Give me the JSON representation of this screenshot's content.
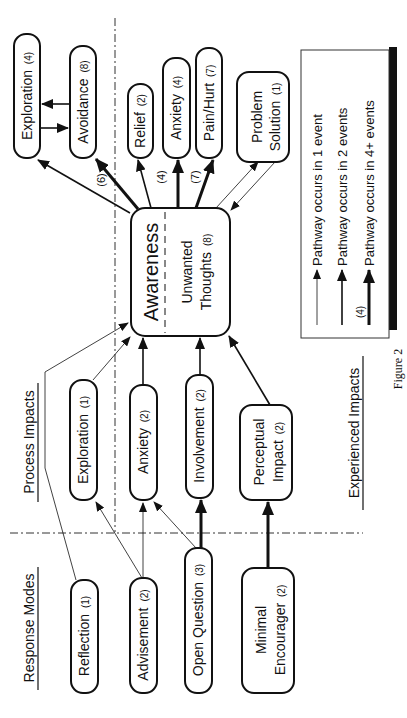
{
  "figure": {
    "caption": "Figure 2",
    "orientation": "rotated-90-ccw"
  },
  "sections": {
    "response_modes": "Response Modes",
    "process_impacts": "Process Impacts",
    "experienced_impacts": "Experienced Impacts"
  },
  "response_modes": [
    {
      "id": "reflection",
      "label": "Reflection",
      "count": "(1)"
    },
    {
      "id": "advisement",
      "label": "Advisement",
      "count": "(2)"
    },
    {
      "id": "open_question",
      "label": "Open Question",
      "count": "(3)"
    },
    {
      "id": "minimal_encourager",
      "label_line1": "Minimal",
      "label_line2": "Encourager",
      "count": "(2)"
    }
  ],
  "process_impacts": [
    {
      "id": "exploration",
      "label": "Exploration",
      "count": "(1)"
    },
    {
      "id": "anxiety",
      "label": "Anxiety",
      "count": "(2)"
    },
    {
      "id": "involvement",
      "label": "Involvement",
      "count": "(2)"
    },
    {
      "id": "perceptual_impact",
      "label_line1": "Perceptual",
      "label_line2": "Impact",
      "count": "(2)"
    }
  ],
  "central": {
    "title": "Awareness",
    "sub_line1": "Unwanted",
    "sub_line2": "Thoughts",
    "sub_count": "(8)"
  },
  "experienced_impacts": [
    {
      "id": "exploration",
      "label": "Exploration",
      "count": "(4)"
    },
    {
      "id": "avoidance",
      "label": "Avoidance",
      "count": "(8)"
    },
    {
      "id": "relief",
      "label": "Relief",
      "count": "(2)"
    },
    {
      "id": "anxiety",
      "label": "Anxiety",
      "count": "(4)"
    },
    {
      "id": "pain_hurt",
      "label": "Pain/Hurt",
      "count": "(7)"
    },
    {
      "id": "problem_solution",
      "label_line1": "Problem",
      "label_line2": "Solution",
      "count": "(1)"
    }
  ],
  "edge_labels": {
    "avoidance": "(6)",
    "anxiety": "(4)",
    "pain_hurt": "(7)"
  },
  "legend": {
    "items": [
      {
        "weight": "thin",
        "label": "Pathway occurs in 1 event"
      },
      {
        "weight": "medium",
        "label": "Pathway occurs in 2 events"
      },
      {
        "weight": "thick",
        "label": "Pathway occurs in 4+ events",
        "count_example": "(4)"
      }
    ]
  },
  "edges": [
    {
      "from": "Reflection",
      "to": "Awareness",
      "weight": "thin"
    },
    {
      "from": "Advisement",
      "to": "Exploration (process)",
      "weight": "thin"
    },
    {
      "from": "Advisement",
      "to": "Anxiety (process)",
      "weight": "thin"
    },
    {
      "from": "Open Question",
      "to": "Anxiety (process)",
      "weight": "thin"
    },
    {
      "from": "Open Question",
      "to": "Involvement",
      "weight": "thick"
    },
    {
      "from": "Minimal Encourager",
      "to": "Perceptual Impact",
      "weight": "thick"
    },
    {
      "from": "Exploration (process)",
      "to": "Awareness",
      "weight": "thin"
    },
    {
      "from": "Anxiety (process)",
      "to": "Awareness",
      "weight": "medium"
    },
    {
      "from": "Involvement",
      "to": "Awareness",
      "weight": "medium"
    },
    {
      "from": "Perceptual Impact",
      "to": "Awareness",
      "weight": "medium"
    },
    {
      "from": "Awareness",
      "to": "Exploration (experienced)",
      "weight": "medium"
    },
    {
      "from": "Awareness",
      "to": "Avoidance",
      "weight": "thick",
      "label": "(6)"
    },
    {
      "from": "Awareness",
      "to": "Relief",
      "weight": "medium"
    },
    {
      "from": "Awareness",
      "to": "Anxiety (experienced)",
      "weight": "thick",
      "label": "(4)"
    },
    {
      "from": "Awareness",
      "to": "Pain/Hurt",
      "weight": "thick",
      "label": "(7)"
    },
    {
      "from": "Awareness",
      "to": "Problem Solution",
      "weight": "thin",
      "bidirectional": true
    },
    {
      "from": "Avoidance",
      "to": "Exploration (experienced)",
      "weight": "medium",
      "bidirectional": true
    }
  ]
}
